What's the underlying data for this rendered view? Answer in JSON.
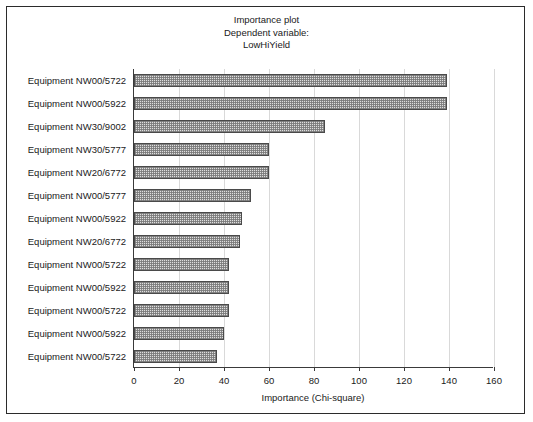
{
  "chart_data": {
    "type": "bar",
    "orientation": "horizontal",
    "title": "Importance plot",
    "subtitle": "Dependent variable:",
    "subtitle2": "LowHiYield",
    "xlabel": "Importance (Chi-square)",
    "ylabel": "",
    "xlim": [
      0,
      160
    ],
    "xticks": [
      0,
      20,
      40,
      60,
      80,
      100,
      120,
      140,
      160
    ],
    "grid": true,
    "legend": false,
    "categories": [
      "Equipment NW00/5722",
      "Equipment NW00/5922",
      "Equipment NW30/9002",
      "Equipment NW30/5777",
      "Equipment NW20/6772",
      "Equipment NW00/5777",
      "Equipment NW00/5922",
      "Equipment NW20/6772",
      "Equipment NW00/5722",
      "Equipment NW00/5922",
      "Equipment NW00/5722",
      "Equipment NW00/5922",
      "Equipment NW00/5722"
    ],
    "values": [
      139,
      139,
      85,
      60,
      60,
      52,
      48,
      47,
      42,
      42,
      42,
      40,
      37
    ],
    "bar_fill": "#dedede",
    "bar_edge": "#4a4a4a",
    "grid_color": "#d9d9d9",
    "axis_color": "#3a3a3a",
    "frame_color": "#2b2b2b",
    "background": "#ffffff"
  }
}
